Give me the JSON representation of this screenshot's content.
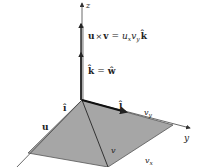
{
  "figure": {
    "axes": {
      "z_label": "z",
      "y_label": "y"
    },
    "equations": {
      "cross_product": {
        "lhs_u": "u",
        "times": "×",
        "lhs_v": "v",
        "eq": "=",
        "rhs_u": "u",
        "rhs_u_sub": "x",
        "rhs_v": "v",
        "rhs_v_sub": "y",
        "rhs_k": "k̂"
      },
      "k_eq_w": {
        "k": "k̂",
        "eq": "=",
        "w": "ŵ"
      }
    },
    "vector_labels": {
      "i": "î",
      "j": "ĵ",
      "u": "u",
      "v": "v",
      "vy": "v",
      "vy_sub": "y",
      "vx": "v",
      "vx_sub": "x"
    },
    "colors": {
      "plane_fill": "#a6a6a6",
      "line": "#333333",
      "background": "#ffffff"
    }
  }
}
